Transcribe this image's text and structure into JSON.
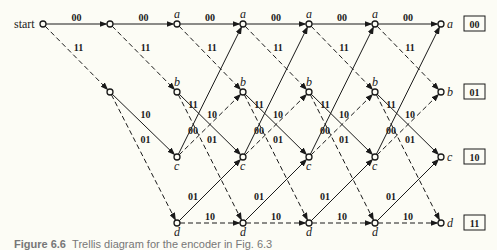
{
  "figure": {
    "start_label": "start",
    "caption_number": "Figure 6.6",
    "caption_text": "Trellis diagram for the encoder in Fig. 6.3",
    "colors": {
      "background": "#fcfcf5",
      "ink": "#1a1a1a",
      "caption": "#777777"
    }
  },
  "trellis": {
    "start": {
      "x": 43,
      "y": 24
    },
    "columns_x": [
      110,
      177,
      243,
      309,
      375,
      441
    ],
    "rows": [
      {
        "state": "a",
        "y": 24,
        "code": "00"
      },
      {
        "state": "b",
        "y": 92,
        "code": "01"
      },
      {
        "state": "c",
        "y": 157,
        "code": "10"
      },
      {
        "state": "d",
        "y": 223,
        "code": "11"
      }
    ],
    "transitions": [
      {
        "from": "a",
        "to": "a",
        "output": "00",
        "style": "solid",
        "input": 0
      },
      {
        "from": "a",
        "to": "b",
        "output": "11",
        "style": "dashed",
        "input": 1
      },
      {
        "from": "b",
        "to": "c",
        "output": "10",
        "style": "solid",
        "input": 0
      },
      {
        "from": "b",
        "to": "d",
        "output": "01",
        "style": "dashed",
        "input": 1
      },
      {
        "from": "c",
        "to": "a",
        "output": "11",
        "style": "solid",
        "input": 0
      },
      {
        "from": "c",
        "to": "b",
        "output": "00",
        "style": "dashed",
        "input": 1
      },
      {
        "from": "d",
        "to": "c",
        "output": "01",
        "style": "solid",
        "input": 0
      },
      {
        "from": "d",
        "to": "d",
        "output": "10",
        "style": "dashed",
        "input": 1
      }
    ],
    "legend": {
      "solid": "input bit 0",
      "dashed": "input bit 1"
    }
  }
}
